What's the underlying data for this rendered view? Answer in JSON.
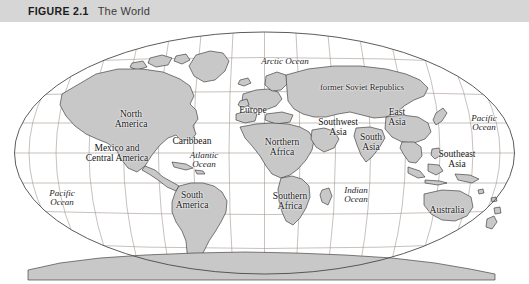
{
  "figure": {
    "number_label": "FIGURE 2.1",
    "title": "The World",
    "header_bg": "#d6d6d6",
    "page_bg": "#ffffff"
  },
  "map": {
    "projection": "elliptical world projection",
    "land_fill": "#c8c8c8",
    "land_stroke": "#2b2b2b",
    "graticule_color": "#9a8e86",
    "border_color": "#4a4a4a",
    "ocean_fill": "#ffffff",
    "labels": [
      {
        "id": "north-america",
        "text": "North\nAmerica",
        "kind": "land",
        "x": 131,
        "y": 98
      },
      {
        "id": "mexico-and-central-america",
        "text": "Mexico and\nCentral America",
        "kind": "land",
        "x": 117,
        "y": 132
      },
      {
        "id": "caribbean",
        "text": "Caribbean",
        "kind": "land",
        "x": 192,
        "y": 120
      },
      {
        "id": "south-america",
        "text": "South\nAmerica",
        "kind": "land",
        "x": 192,
        "y": 179
      },
      {
        "id": "europe",
        "text": "Europe",
        "kind": "land",
        "x": 253,
        "y": 89
      },
      {
        "id": "former-soviet-republics",
        "text": "former Soviet Republics",
        "kind": "land",
        "x": 362,
        "y": 65
      },
      {
        "id": "northern-africa",
        "text": "Northern\nAfrica",
        "kind": "land",
        "x": 282,
        "y": 126
      },
      {
        "id": "southern-africa",
        "text": "Southern\nAfrica",
        "kind": "land",
        "x": 290,
        "y": 180
      },
      {
        "id": "southwest-asia",
        "text": "Southwest\nAsia",
        "kind": "land",
        "x": 338,
        "y": 106
      },
      {
        "id": "south-asia",
        "text": "South\nAsia",
        "kind": "land",
        "x": 371,
        "y": 121
      },
      {
        "id": "east-asia",
        "text": "East\nAsia",
        "kind": "land",
        "x": 397,
        "y": 96
      },
      {
        "id": "southeast-asia",
        "text": "Southeast\nAsia",
        "kind": "land",
        "x": 457,
        "y": 138
      },
      {
        "id": "australia",
        "text": "Australia",
        "kind": "land",
        "x": 447,
        "y": 189
      },
      {
        "id": "antarctica",
        "text": "Antarctica",
        "kind": "land",
        "x": 290,
        "y": 268
      },
      {
        "id": "arctic-ocean",
        "text": "Arctic Ocean",
        "kind": "ocean",
        "x": 285,
        "y": 40
      },
      {
        "id": "atlantic-ocean",
        "text": "Atlantic\nOcean",
        "kind": "ocean",
        "x": 204,
        "y": 138
      },
      {
        "id": "pacific-ocean-west",
        "text": "Pacific\nOcean",
        "kind": "ocean",
        "x": 62,
        "y": 176
      },
      {
        "id": "pacific-ocean-east",
        "text": "Pacific\nOcean",
        "kind": "ocean",
        "x": 484,
        "y": 101
      },
      {
        "id": "indian-ocean",
        "text": "Indian\nOcean",
        "kind": "ocean",
        "x": 356,
        "y": 173
      }
    ]
  }
}
